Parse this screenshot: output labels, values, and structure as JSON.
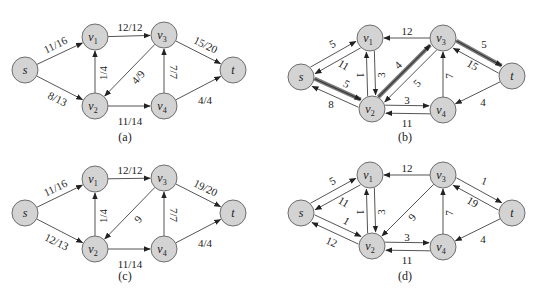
{
  "node_style": {
    "fill": "#d3d3d3",
    "stroke": "#6e6e6e",
    "radius": 13
  },
  "panels": [
    {
      "id": "a",
      "caption": "(a)",
      "caption_pos": [
        125,
        141
      ],
      "nodes": {
        "s": {
          "label": "s",
          "sub": "",
          "x": 25,
          "y": 70
        },
        "v1": {
          "label": "v",
          "sub": "1",
          "x": 95,
          "y": 37
        },
        "v2": {
          "label": "v",
          "sub": "2",
          "x": 95,
          "y": 106
        },
        "v3": {
          "label": "v",
          "sub": "3",
          "x": 164,
          "y": 35
        },
        "v4": {
          "label": "v",
          "sub": "4",
          "x": 164,
          "y": 106
        },
        "t": {
          "label": "t",
          "sub": "",
          "x": 233,
          "y": 70
        }
      },
      "edges": [
        {
          "from": "s",
          "to": "v1",
          "label": "11/16",
          "lx": 56,
          "ly": 46,
          "rot": -26
        },
        {
          "from": "s",
          "to": "v2",
          "label": "8/13",
          "lx": 57,
          "ly": 100,
          "rot": 26
        },
        {
          "from": "v2",
          "to": "v1",
          "label": "1/4",
          "lx": 104,
          "ly": 73,
          "rot": -90
        },
        {
          "from": "v1",
          "to": "v3",
          "label": "12/12",
          "lx": 130,
          "ly": 28,
          "rot": 0
        },
        {
          "from": "v3",
          "to": "v2",
          "label": "4/9",
          "lx": 139,
          "ly": 78,
          "rot": -50
        },
        {
          "from": "v2",
          "to": "v4",
          "label": "11/14",
          "lx": 130,
          "ly": 122,
          "rot": 0
        },
        {
          "from": "v4",
          "to": "v3",
          "label": "7/7",
          "lx": 173,
          "ly": 72,
          "rot": 90
        },
        {
          "from": "v3",
          "to": "t",
          "label": "15/20",
          "lx": 205,
          "ly": 46,
          "rot": 26
        },
        {
          "from": "v4",
          "to": "t",
          "label": "4/4",
          "lx": 205,
          "ly": 101,
          "rot": 0
        }
      ]
    },
    {
      "id": "b",
      "caption": "(b)",
      "caption_pos": [
        405,
        141
      ],
      "nodes": {
        "s": {
          "label": "s",
          "sub": "",
          "x": 301,
          "y": 77
        },
        "v1": {
          "label": "v",
          "sub": "1",
          "x": 370,
          "y": 38
        },
        "v2": {
          "label": "v",
          "sub": "2",
          "x": 372,
          "y": 109
        },
        "v3": {
          "label": "v",
          "sub": "3",
          "x": 443,
          "y": 38
        },
        "v4": {
          "label": "v",
          "sub": "4",
          "x": 443,
          "y": 110
        },
        "t": {
          "label": "t",
          "sub": "",
          "x": 512,
          "y": 76
        }
      },
      "edges": [
        {
          "from": "s",
          "to": "v1",
          "label": "5",
          "off": -4,
          "lx": 333,
          "ly": 45,
          "rot": -28,
          "thick": false
        },
        {
          "from": "v1",
          "to": "s",
          "label": "11",
          "off": -4,
          "lx": 343,
          "ly": 66,
          "rot": 30,
          "thick": false
        },
        {
          "from": "s",
          "to": "v2",
          "label": "5",
          "off": -4,
          "lx": 346,
          "ly": 85,
          "rot": 30,
          "thick": true
        },
        {
          "from": "v2",
          "to": "s",
          "label": "8",
          "off": -4,
          "lx": 331,
          "ly": 105,
          "rot": 0,
          "thick": false
        },
        {
          "from": "v1",
          "to": "v2",
          "label": "1",
          "off": -4,
          "lx": 360,
          "ly": 75,
          "rot": 90,
          "thick": false
        },
        {
          "from": "v2",
          "to": "v1",
          "label": "3",
          "off": -4,
          "lx": 382,
          "ly": 75,
          "rot": -90,
          "thick": false
        },
        {
          "from": "v3",
          "to": "v1",
          "label": "12",
          "off": 0,
          "lx": 407,
          "ly": 32,
          "rot": 0,
          "thick": false
        },
        {
          "from": "v2",
          "to": "v3",
          "label": "4",
          "off": -4,
          "lx": 399,
          "ly": 66,
          "rot": -45,
          "thick": true
        },
        {
          "from": "v3",
          "to": "v2",
          "label": "5",
          "off": -4,
          "lx": 418,
          "ly": 84,
          "rot": -45,
          "thick": false
        },
        {
          "from": "v2",
          "to": "v4",
          "label": "3",
          "off": -4,
          "lx": 407,
          "ly": 101,
          "rot": 0,
          "thick": false
        },
        {
          "from": "v4",
          "to": "v2",
          "label": "11",
          "off": -4,
          "lx": 407,
          "ly": 124,
          "rot": 0,
          "thick": false
        },
        {
          "from": "v4",
          "to": "v3",
          "label": "7",
          "off": 0,
          "lx": 450,
          "ly": 76,
          "rot": -90,
          "thick": false
        },
        {
          "from": "v3",
          "to": "t",
          "label": "5",
          "off": -4,
          "lx": 484,
          "ly": 45,
          "rot": 0,
          "thick": true
        },
        {
          "from": "t",
          "to": "v3",
          "label": "15",
          "off": -4,
          "lx": 472,
          "ly": 66,
          "rot": 30,
          "thick": false
        },
        {
          "from": "t",
          "to": "v4",
          "label": "4",
          "off": 0,
          "lx": 483,
          "ly": 103,
          "rot": 0,
          "thick": false
        }
      ]
    },
    {
      "id": "c",
      "caption": "(c)",
      "caption_pos": [
        125,
        280
      ],
      "nodes": {
        "s": {
          "label": "s",
          "sub": "",
          "x": 25,
          "y": 213
        },
        "v1": {
          "label": "v",
          "sub": "1",
          "x": 95,
          "y": 179
        },
        "v2": {
          "label": "v",
          "sub": "2",
          "x": 95,
          "y": 249
        },
        "v3": {
          "label": "v",
          "sub": "3",
          "x": 164,
          "y": 178
        },
        "v4": {
          "label": "v",
          "sub": "4",
          "x": 164,
          "y": 249
        },
        "t": {
          "label": "t",
          "sub": "",
          "x": 233,
          "y": 213
        }
      },
      "edges": [
        {
          "from": "s",
          "to": "v1",
          "label": "11/16",
          "lx": 56,
          "ly": 189,
          "rot": -26
        },
        {
          "from": "s",
          "to": "v2",
          "label": "12/13",
          "lx": 56,
          "ly": 243,
          "rot": 26
        },
        {
          "from": "v2",
          "to": "v1",
          "label": "1/4",
          "lx": 104,
          "ly": 216,
          "rot": -90
        },
        {
          "from": "v1",
          "to": "v3",
          "label": "12/12",
          "lx": 130,
          "ly": 171,
          "rot": 0
        },
        {
          "from": "v3",
          "to": "v2",
          "label": "9",
          "lx": 139,
          "ly": 220,
          "rot": -50
        },
        {
          "from": "v2",
          "to": "v4",
          "label": "11/14",
          "lx": 130,
          "ly": 265,
          "rot": 0
        },
        {
          "from": "v4",
          "to": "v3",
          "label": "7/7",
          "lx": 173,
          "ly": 215,
          "rot": 90
        },
        {
          "from": "v3",
          "to": "t",
          "label": "19/20",
          "lx": 205,
          "ly": 189,
          "rot": 26
        },
        {
          "from": "v4",
          "to": "t",
          "label": "4/4",
          "lx": 205,
          "ly": 244,
          "rot": 0
        }
      ]
    },
    {
      "id": "d",
      "caption": "(d)",
      "caption_pos": [
        405,
        280
      ],
      "nodes": {
        "s": {
          "label": "s",
          "sub": "",
          "x": 301,
          "y": 213
        },
        "v1": {
          "label": "v",
          "sub": "1",
          "x": 370,
          "y": 175
        },
        "v2": {
          "label": "v",
          "sub": "2",
          "x": 372,
          "y": 246
        },
        "v3": {
          "label": "v",
          "sub": "3",
          "x": 443,
          "y": 175
        },
        "v4": {
          "label": "v",
          "sub": "4",
          "x": 443,
          "y": 247
        },
        "t": {
          "label": "t",
          "sub": "",
          "x": 512,
          "y": 213
        }
      },
      "edges": [
        {
          "from": "s",
          "to": "v1",
          "label": "5",
          "off": -4,
          "lx": 333,
          "ly": 182,
          "rot": -28
        },
        {
          "from": "v1",
          "to": "s",
          "label": "11",
          "off": -4,
          "lx": 343,
          "ly": 203,
          "rot": 30
        },
        {
          "from": "s",
          "to": "v2",
          "label": "1",
          "off": -4,
          "lx": 346,
          "ly": 222,
          "rot": 30
        },
        {
          "from": "v2",
          "to": "s",
          "label": "12",
          "off": -4,
          "lx": 331,
          "ly": 243,
          "rot": 25
        },
        {
          "from": "v1",
          "to": "v2",
          "label": "1",
          "off": -4,
          "lx": 360,
          "ly": 212,
          "rot": 90
        },
        {
          "from": "v2",
          "to": "v1",
          "label": "3",
          "off": -4,
          "lx": 382,
          "ly": 212,
          "rot": -90
        },
        {
          "from": "v3",
          "to": "v1",
          "label": "12",
          "off": 0,
          "lx": 407,
          "ly": 169,
          "rot": 0
        },
        {
          "from": "v3",
          "to": "v2",
          "label": "9",
          "off": 0,
          "lx": 413,
          "ly": 218,
          "rot": -50
        },
        {
          "from": "v2",
          "to": "v4",
          "label": "3",
          "off": -4,
          "lx": 407,
          "ly": 238,
          "rot": 0
        },
        {
          "from": "v4",
          "to": "v2",
          "label": "11",
          "off": -4,
          "lx": 407,
          "ly": 261,
          "rot": 0
        },
        {
          "from": "v4",
          "to": "v3",
          "label": "7",
          "off": 0,
          "lx": 450,
          "ly": 213,
          "rot": -90
        },
        {
          "from": "v3",
          "to": "t",
          "label": "1",
          "off": -4,
          "lx": 484,
          "ly": 182,
          "rot": 20
        },
        {
          "from": "t",
          "to": "v3",
          "label": "19",
          "off": -4,
          "lx": 472,
          "ly": 203,
          "rot": 30
        },
        {
          "from": "t",
          "to": "v4",
          "label": "4",
          "off": 0,
          "lx": 483,
          "ly": 240,
          "rot": 0
        }
      ]
    }
  ]
}
